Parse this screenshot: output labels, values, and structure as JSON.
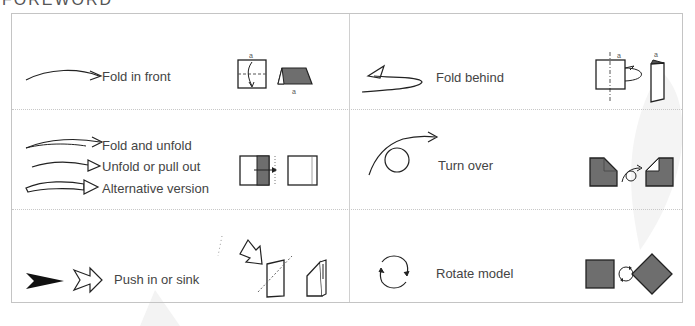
{
  "header": {
    "title": "FOREWORD"
  },
  "colors": {
    "stroke": "#222222",
    "fill_dark": "#6e6e6e",
    "border": "#c4c4c4",
    "divider": "#c8c8c8"
  },
  "symbols": [
    {
      "id": "fold-in-front",
      "labels": [
        "Fold in front"
      ],
      "diagram_letters": [
        "a",
        "a"
      ]
    },
    {
      "id": "fold-behind",
      "labels": [
        "Fold behind"
      ],
      "diagram_letters": [
        "a",
        "a"
      ]
    },
    {
      "id": "fold-unfold-group",
      "labels": [
        "Fold and unfold",
        "Unfold or pull out",
        "Alternative version"
      ]
    },
    {
      "id": "turn-over",
      "labels": [
        "Turn over"
      ]
    },
    {
      "id": "push-in-sink",
      "labels": [
        "Push in or sink"
      ]
    },
    {
      "id": "rotate-model",
      "labels": [
        "Rotate model"
      ]
    }
  ]
}
